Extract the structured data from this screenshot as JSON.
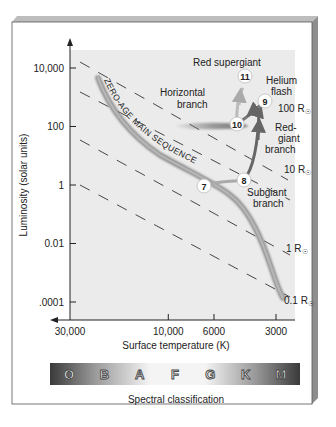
{
  "chart_data": {
    "type": "diagram",
    "ylabel": "Luminosity (solar units)",
    "xlabel": "Surface temperature (K)",
    "y_scale": "log",
    "x_scale": "log-reversed",
    "ylim": [
      3e-05,
      50000
    ],
    "xlim": [
      30000,
      2600
    ],
    "y_ticks": [
      {
        "value": 10000,
        "label": "10,000"
      },
      {
        "value": 100,
        "label": "100"
      },
      {
        "value": 1,
        "label": "1"
      },
      {
        "value": 0.01,
        "label": "0.01"
      },
      {
        "value": 0.0001,
        "label": ".0001"
      }
    ],
    "x_ticks": [
      {
        "value": 30000,
        "label": "30,000"
      },
      {
        "value": 10000,
        "label": "10,000"
      },
      {
        "value": 6000,
        "label": "6000"
      },
      {
        "value": 3000,
        "label": "3000"
      }
    ],
    "radius_lines": [
      {
        "label": "100 R",
        "symbol": "☉"
      },
      {
        "label": "10 R",
        "symbol": "☉"
      },
      {
        "label": "1 R",
        "symbol": "☉"
      },
      {
        "label": "0.1 R",
        "symbol": "☉"
      }
    ],
    "main_sequence_label": "ZERO-AGE MAIN SEQUENCE",
    "region_labels": {
      "red_supergiant": "Red supergiant",
      "horizontal_branch": [
        "Horizontal",
        "branch"
      ],
      "helium_flash": [
        "Helium",
        "flash"
      ],
      "red_giant_branch": [
        "Red-",
        "giant",
        "branch"
      ],
      "subgiant_branch": [
        "Subgiant",
        "branch"
      ]
    },
    "stages": [
      {
        "label": "7",
        "T": 5800,
        "L": 1
      },
      {
        "label": "8",
        "T": 4800,
        "L": 3
      },
      {
        "label": "9",
        "T": 4100,
        "L": 400
      },
      {
        "label": "10",
        "T": 4800,
        "L": 100
      },
      {
        "label": "11",
        "T": 4400,
        "L": 4000
      }
    ],
    "spectral_classes": [
      "O",
      "B",
      "A",
      "F",
      "G",
      "K",
      "M"
    ],
    "spectral_label": "Spectral classification"
  }
}
